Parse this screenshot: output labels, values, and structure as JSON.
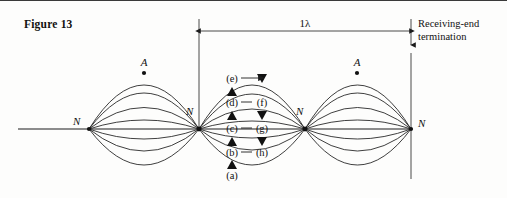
{
  "figure": {
    "caption": "Figure 13",
    "type": "standing-wave-transmission-line-diagram"
  },
  "dimension": {
    "label": "1λ",
    "start_x": 199,
    "end_x": 411,
    "y": 30,
    "arrows": "both"
  },
  "termination": {
    "label_line1": "Receiving-end",
    "label_line2": "termination",
    "x": 411
  },
  "nodes": [
    {
      "label": "N",
      "x": 89,
      "y": 128
    },
    {
      "label": "N",
      "x": 199,
      "y": 128
    },
    {
      "label": "N",
      "x": 305,
      "y": 128
    },
    {
      "label": "N",
      "x": 411,
      "y": 128
    }
  ],
  "antinodes": [
    {
      "label": "A",
      "x": 144,
      "y": 70
    },
    {
      "label": "A",
      "x": 357,
      "y": 70
    }
  ],
  "phase_labels": [
    {
      "label": "(e)",
      "x": 232,
      "y": 77,
      "marker": "none"
    },
    {
      "label": "(d)",
      "x": 232,
      "y": 101,
      "marker": "up-triangle"
    },
    {
      "label": "(c)",
      "x": 232,
      "y": 127,
      "marker": "up-triangle"
    },
    {
      "label": "(b)",
      "x": 232,
      "y": 151,
      "marker": "up-triangle"
    },
    {
      "label": "(a)",
      "x": 232,
      "y": 174,
      "marker": "up-triangle"
    },
    {
      "label": "(f)",
      "x": 262,
      "y": 101,
      "marker": "down-triangle"
    },
    {
      "label": "(g)",
      "x": 262,
      "y": 127,
      "marker": "down-triangle"
    },
    {
      "label": "(h)",
      "x": 262,
      "y": 151,
      "marker": "down-triangle"
    }
  ],
  "colors": {
    "ink": "#1c1c1c",
    "text": "#111111",
    "background": "#fdfdfc",
    "rule": "#3a3a3a"
  }
}
